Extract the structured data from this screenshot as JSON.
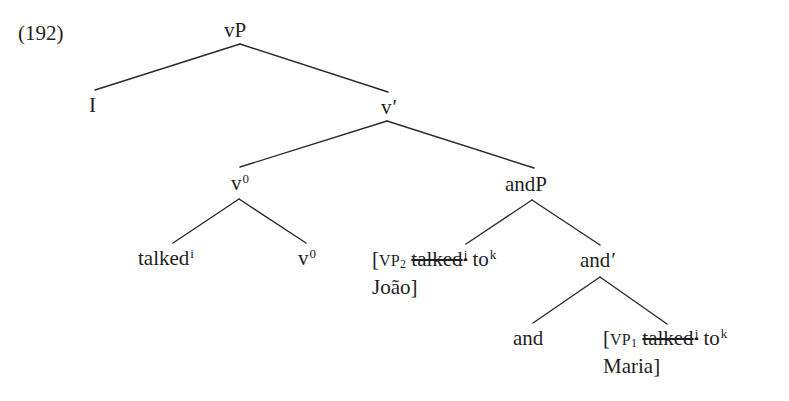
{
  "example": {
    "number": "(192)"
  },
  "tree": {
    "root": {
      "label": "vP"
    },
    "specifier": {
      "label": "I"
    },
    "v_bar": {
      "label": "v",
      "prime": "′"
    },
    "v0_head": {
      "label": "v",
      "sup": "0"
    },
    "talked": {
      "label": "talked",
      "sup": "i"
    },
    "v0_leaf": {
      "label": "v",
      "sup": "0"
    },
    "andP": {
      "label": "andP"
    },
    "vp2": {
      "bracket": "[",
      "category": "VP",
      "sub": "2",
      "struck_word": "talked",
      "struck_sup": "i",
      "word": "to",
      "word_sup": "k",
      "line2": "João]"
    },
    "and_bar": {
      "label": "and",
      "prime": "′"
    },
    "and_head": {
      "label": "and"
    },
    "vp1": {
      "bracket": "[",
      "category": "VP",
      "sub": "1",
      "struck_word": "talked",
      "struck_sup": "i",
      "word": "to",
      "word_sup": "k",
      "line2": "Maria]"
    }
  },
  "edges": [
    {
      "from": "vP",
      "to": "I"
    },
    {
      "from": "vP",
      "to": "v′"
    },
    {
      "from": "v′",
      "to": "v0"
    },
    {
      "from": "v′",
      "to": "andP"
    },
    {
      "from": "v0",
      "to": "talked"
    },
    {
      "from": "v0",
      "to": "v0_leaf"
    },
    {
      "from": "andP",
      "to": "VP2"
    },
    {
      "from": "andP",
      "to": "and′"
    },
    {
      "from": "and′",
      "to": "and"
    },
    {
      "from": "and′",
      "to": "VP1"
    }
  ],
  "colors": {
    "ink": "#1e1e1e",
    "background": "#ffffff"
  }
}
